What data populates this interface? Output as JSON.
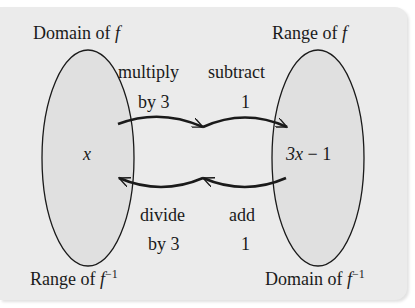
{
  "figure": {
    "panel_color": "#ebebeb",
    "ellipse_fill": "#e0e0e0",
    "stroke_color": "#1a1a1a",
    "labels": {
      "domain_f": "Domain of",
      "range_f": "Range of",
      "range_f_inv": "Range of",
      "domain_f_inv": "Domain of",
      "f_symbol": "f",
      "inverse_exponent": "−1"
    },
    "left_set": {
      "element": "x"
    },
    "right_set": {
      "element_var": "3x",
      "element_rest": " − 1"
    },
    "forward_steps": [
      {
        "line1": "multiply",
        "line2": "by 3"
      },
      {
        "line1": "subtract",
        "line2": "1"
      }
    ],
    "inverse_steps": [
      {
        "line1": "divide",
        "line2": "by 3"
      },
      {
        "line1": "add",
        "line2": "1"
      }
    ]
  }
}
